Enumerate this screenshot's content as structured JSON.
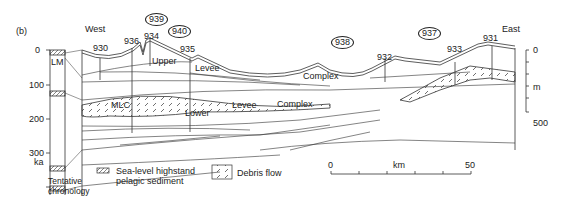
{
  "panel_label": "(b)",
  "direction": {
    "west": "West",
    "east": "East"
  },
  "sites": [
    {
      "id": "930"
    },
    {
      "id": "936"
    },
    {
      "id": "934"
    },
    {
      "id": "935"
    },
    {
      "id": "932"
    },
    {
      "id": "933"
    },
    {
      "id": "931"
    }
  ],
  "circled_sites": [
    {
      "id": "939"
    },
    {
      "id": "940"
    },
    {
      "id": "938"
    },
    {
      "id": "937"
    }
  ],
  "units": {
    "upper": "Upper",
    "levee_upper": "Levee",
    "complex_upper": "Complex",
    "mlc": "MLC",
    "lower": "Lower",
    "levee_lower": "Levee",
    "complex_lower": "Complex",
    "lm": "LM"
  },
  "chronology": {
    "ticks": [
      "0",
      "100",
      "200",
      "300"
    ],
    "unit": "ka",
    "caption_line1": "Tentative",
    "caption_line2": "chronology"
  },
  "depth_scale": {
    "top": "0",
    "unit": "m",
    "bottom": "500"
  },
  "distance_scale": {
    "start": "0",
    "unit": "km",
    "end": "50"
  },
  "legend": {
    "highstand_line1": "Sea-level highstand",
    "highstand_line2": "pelagic sediment",
    "debris_flow": "Debris flow"
  }
}
